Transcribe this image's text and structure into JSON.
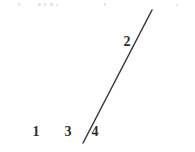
{
  "figure": {
    "type": "geometry-diagram",
    "canvas": {
      "width": 195,
      "height": 152
    },
    "background_color": "#ffffff",
    "stroke_color": "#3a3a3a",
    "baseline_color": "#6e6e6e",
    "label_color": "#2e2e2e",
    "points": {
      "apex": {
        "name": "apex-vertex",
        "x": 152,
        "y": 10
      },
      "left": {
        "name": "left-vertex",
        "x": 12,
        "y": 143
      },
      "cevian_foot": {
        "name": "cevian-foot-vertex",
        "x": 83,
        "y": 143
      },
      "base_right": {
        "name": "baseline-right-end",
        "x": 186,
        "y": 143
      }
    },
    "segments": [
      {
        "name": "baseline",
        "from": "left",
        "to": "base_right",
        "color": "#6e6e6e",
        "width": 1.6
      },
      {
        "name": "long-side",
        "from": "left",
        "to": "apex",
        "color": "#3a3a3a",
        "width": 1.5
      },
      {
        "name": "cevian-segment",
        "from": "cevian_foot",
        "to": "apex",
        "color": "#3a3a3a",
        "width": 1.5
      }
    ],
    "labels": [
      {
        "id": "angle-1",
        "text": "1",
        "x": 36,
        "y": 132,
        "description": "angle at left vertex between baseline and long side"
      },
      {
        "id": "angle-3",
        "text": "3",
        "x": 68,
        "y": 132,
        "description": "angle left of cevian foot, above baseline"
      },
      {
        "id": "angle-4",
        "text": "4",
        "x": 95,
        "y": 132,
        "description": "angle right of cevian foot, above baseline"
      },
      {
        "id": "angle-2",
        "text": "2",
        "x": 127,
        "y": 42,
        "description": "angle at apex between long side and cevian"
      }
    ],
    "top_artifacts": [
      {
        "x": 18,
        "y": 3,
        "w": 2,
        "h": 3
      },
      {
        "x": 38,
        "y": 3,
        "w": 3,
        "h": 3
      },
      {
        "x": 44,
        "y": 3,
        "w": 2,
        "h": 3
      },
      {
        "x": 50,
        "y": 3,
        "w": 3,
        "h": 3
      },
      {
        "x": 56,
        "y": 4,
        "w": 2,
        "h": 2
      },
      {
        "x": 104,
        "y": 3,
        "w": 2,
        "h": 3
      },
      {
        "x": 176,
        "y": 4,
        "w": 2,
        "h": 2
      }
    ]
  }
}
